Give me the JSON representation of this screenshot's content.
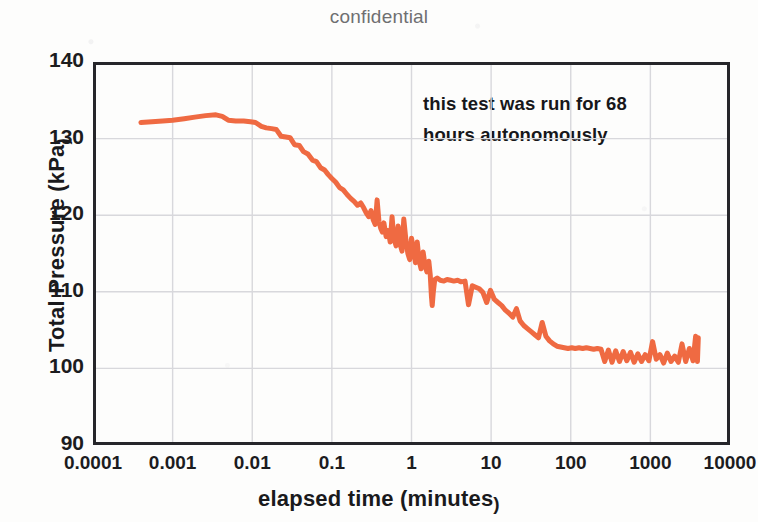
{
  "chart_data": {
    "type": "line",
    "title": "confidential",
    "subtitle": "",
    "xlabel": "elapsed time (minutes)",
    "ylabel": "Total Pressure (kPa)",
    "xscale": "log",
    "yscale": "linear",
    "xlim": [
      0.0001,
      10000
    ],
    "ylim": [
      90,
      140
    ],
    "xticks": [
      "0.0001",
      "0.001",
      "0.01",
      "0.1",
      "1",
      "10",
      "100",
      "1000",
      "10000"
    ],
    "xtick_values": [
      0.0001,
      0.001,
      0.01,
      0.1,
      1,
      10,
      100,
      1000,
      10000
    ],
    "yticks": [
      "90",
      "100",
      "110",
      "120",
      "130",
      "140"
    ],
    "ytick_values": [
      90,
      100,
      110,
      120,
      130,
      140
    ],
    "grid": true,
    "grid_color": "#d8d8dc",
    "legend": false,
    "line_color": "#ef6a42",
    "line_width": 5,
    "frame_color": "#26262a",
    "annotations": [
      {
        "text_line_1": "this test was run for 68",
        "text_line_2": "hours autonomously",
        "x": 1.6,
        "y": 136
      }
    ],
    "series": [
      {
        "name": "Total Pressure",
        "color": "#ef6a42",
        "x": [
          0.0004,
          0.00055,
          0.00075,
          0.001,
          0.0014,
          0.0019,
          0.0026,
          0.0035,
          0.0042,
          0.005,
          0.0062,
          0.0078,
          0.0095,
          0.011,
          0.013,
          0.015,
          0.0175,
          0.02,
          0.023,
          0.0265,
          0.03,
          0.034,
          0.039,
          0.044,
          0.05,
          0.057,
          0.064,
          0.072,
          0.081,
          0.09,
          0.1,
          0.112,
          0.125,
          0.139,
          0.155,
          0.172,
          0.19,
          0.21,
          0.23,
          0.25,
          0.27,
          0.29,
          0.31,
          0.33,
          0.35,
          0.37,
          0.39,
          0.41,
          0.43,
          0.45,
          0.48,
          0.51,
          0.54,
          0.57,
          0.6,
          0.64,
          0.68,
          0.72,
          0.76,
          0.8,
          0.85,
          0.9,
          0.95,
          1.0,
          1.06,
          1.12,
          1.18,
          1.25,
          1.32,
          1.4,
          1.48,
          1.56,
          1.65,
          1.72,
          1.78,
          1.82,
          1.88,
          1.96,
          2.1,
          2.3,
          2.55,
          2.8,
          3.1,
          3.4,
          3.8,
          4.2,
          4.7,
          5.2,
          5.8,
          6.4,
          7.1,
          7.9,
          8.8,
          9.8,
          11.0,
          12.2,
          13.6,
          15.1,
          16.8,
          18.7,
          20.8,
          23.1,
          25.7,
          28.6,
          31.8,
          35.4,
          39.4,
          43.8,
          48.7,
          54.2,
          60.3,
          67.1,
          74.6,
          83.0,
          92.3,
          103.0,
          114.0,
          127.0,
          141.0,
          157.0,
          175.0,
          194.0,
          216.0,
          240.0,
          267.0,
          297.0,
          330.0,
          367.0,
          409.0,
          455.0,
          506.0,
          563.0,
          626.0,
          696.0,
          774.0,
          861.0,
          958.0,
          1066.0,
          1185.0,
          1318.0,
          1466.0,
          1631.0,
          1814.0,
          2018.0,
          2245.0,
          2497.0,
          2778.0,
          3090.0,
          3437.0,
          3700.0,
          3900.0,
          4000.0
        ],
        "y": [
          132.1,
          132.2,
          132.3,
          132.4,
          132.6,
          132.8,
          133.0,
          133.1,
          132.9,
          132.4,
          132.3,
          132.3,
          132.2,
          132.1,
          131.6,
          131.4,
          131.3,
          131.2,
          130.3,
          130.2,
          130.1,
          129.2,
          129.1,
          128.3,
          128.0,
          127.2,
          127.0,
          126.2,
          125.9,
          125.3,
          124.8,
          124.3,
          123.6,
          123.3,
          122.7,
          122.2,
          121.8,
          121.3,
          121.6,
          121.0,
          120.3,
          119.8,
          120.6,
          119.4,
          118.8,
          122.0,
          119.2,
          118.3,
          117.8,
          119.0,
          117.2,
          118.0,
          116.5,
          119.8,
          117.0,
          116.0,
          118.6,
          116.2,
          115.3,
          119.5,
          116.8,
          115.0,
          114.2,
          117.0,
          115.5,
          113.8,
          116.5,
          114.0,
          113.0,
          115.2,
          113.4,
          112.6,
          114.0,
          112.2,
          109.4,
          108.2,
          110.0,
          111.6,
          111.8,
          111.5,
          111.4,
          111.6,
          111.5,
          111.4,
          111.5,
          111.3,
          111.4,
          108.3,
          110.8,
          110.6,
          110.4,
          109.9,
          108.6,
          110.2,
          109.0,
          108.6,
          108.2,
          107.6,
          107.2,
          106.7,
          107.8,
          106.2,
          105.6,
          105.2,
          104.8,
          104.4,
          104.0,
          106.0,
          104.2,
          103.6,
          103.2,
          102.9,
          102.8,
          102.7,
          102.6,
          102.7,
          102.6,
          102.7,
          102.6,
          102.7,
          102.6,
          102.5,
          102.6,
          102.5,
          100.9,
          102.4,
          100.8,
          102.3,
          100.9,
          102.2,
          101.0,
          102.1,
          100.8,
          101.9,
          100.9,
          101.8,
          101.0,
          103.5,
          101.2,
          101.8,
          100.7,
          102.0,
          100.9,
          101.6,
          100.8,
          103.2,
          100.9,
          102.6,
          101.0,
          104.2,
          100.9,
          104.0
        ]
      }
    ]
  }
}
